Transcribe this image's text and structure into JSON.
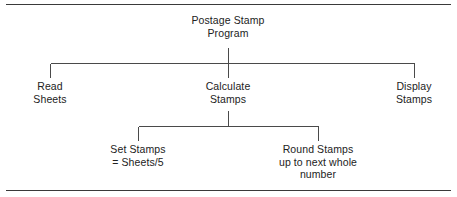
{
  "figure": {
    "type": "structure-chart",
    "frame": {
      "top_rule": true,
      "bottom_rule": true
    },
    "colors": {
      "text": "#222222",
      "connector": "#4a4a4a",
      "rule": "#3a3a3a",
      "background": "#ffffff"
    }
  },
  "nodes": {
    "root": {
      "id": "postage-stamp-program",
      "lines": [
        "Postage Stamp",
        "Program"
      ],
      "level": 0,
      "x": 228,
      "y": 14
    },
    "read_sheets": {
      "id": "read-sheets",
      "lines": [
        "Read",
        "Sheets"
      ],
      "level": 1,
      "x": 50,
      "y": 80
    },
    "calculate_stamps": {
      "id": "calculate-stamps",
      "lines": [
        "Calculate",
        "Stamps"
      ],
      "level": 1,
      "x": 228,
      "y": 80
    },
    "display_stamps": {
      "id": "display-stamps",
      "lines": [
        "Display",
        "Stamps"
      ],
      "level": 1,
      "x": 414,
      "y": 80
    },
    "set_stamps": {
      "id": "set-stamps",
      "lines": [
        "Set Stamps",
        "= Sheets/5"
      ],
      "level": 2,
      "x": 138,
      "y": 143
    },
    "round_stamps": {
      "id": "round-stamps",
      "lines": [
        "Round Stamps",
        "up to next whole",
        "number"
      ],
      "level": 2,
      "x": 318,
      "y": 143
    }
  },
  "edges": [
    {
      "from": "postage-stamp-program",
      "to": "read-sheets"
    },
    {
      "from": "postage-stamp-program",
      "to": "calculate-stamps"
    },
    {
      "from": "postage-stamp-program",
      "to": "display-stamps"
    },
    {
      "from": "calculate-stamps",
      "to": "set-stamps"
    },
    {
      "from": "calculate-stamps",
      "to": "round-stamps"
    }
  ]
}
